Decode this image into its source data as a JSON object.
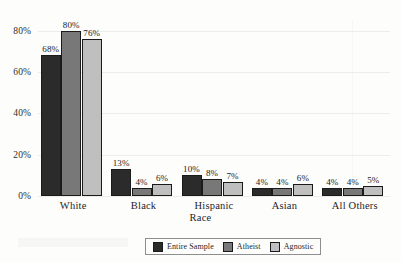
{
  "chart_data": {
    "type": "bar",
    "title": "",
    "xlabel": "Race",
    "ylabel": "",
    "categories": [
      "White",
      "Black",
      "Hispanic",
      "Asian",
      "All Others"
    ],
    "series": [
      {
        "name": "Entire Sample",
        "color": "#2b2b2b",
        "values": [
          68,
          13,
          10,
          4,
          4
        ]
      },
      {
        "name": "Atheist",
        "color": "#787878",
        "values": [
          80,
          4,
          8,
          4,
          4
        ]
      },
      {
        "name": "Agnostic",
        "color": "#bfbfbf",
        "values": [
          76,
          6,
          7,
          6,
          5
        ]
      }
    ],
    "value_labels": [
      [
        "68%",
        "80%",
        "76%"
      ],
      [
        "13%",
        "4%",
        "6%"
      ],
      [
        "10%",
        "8%",
        "7%"
      ],
      [
        "4%",
        "4%",
        "6%"
      ],
      [
        "4%",
        "4%",
        "5%"
      ]
    ],
    "ylim": [
      0,
      88
    ],
    "yticks": [
      0,
      20,
      40,
      60,
      80
    ],
    "ytick_labels": [
      "0%",
      "20%",
      "40%",
      "60%",
      "80%"
    ],
    "grid": true,
    "legend_position": "bottom"
  }
}
